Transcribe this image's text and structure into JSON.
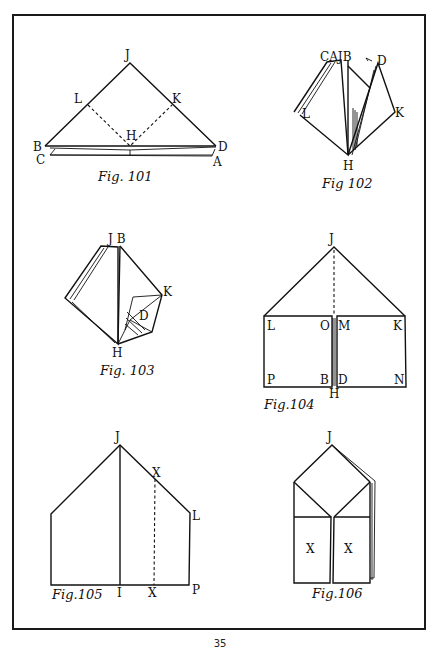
{
  "page": {
    "number": "35"
  },
  "figures": [
    {
      "id": "fig101",
      "caption": "Fig. 101",
      "labels": {
        "J": "J",
        "L": "L",
        "K": "K",
        "H": "H",
        "B": "B",
        "D": "D",
        "C": "C",
        "A": "A"
      }
    },
    {
      "id": "fig102",
      "caption": "Fig 102",
      "labels": {
        "CAJB": "CAJB",
        "D": "D",
        "L": "L",
        "K": "K",
        "H": "H"
      }
    },
    {
      "id": "fig103",
      "caption": "Fig. 103",
      "labels": {
        "JB": "J B",
        "K": "K",
        "D": "D",
        "H": "H"
      }
    },
    {
      "id": "fig104",
      "caption": "Fig.104",
      "labels": {
        "J": "J",
        "L": "L",
        "O": "O",
        "M": "M",
        "K": "K",
        "P": "P",
        "B": "B",
        "D": "D",
        "N": "N",
        "H": "H"
      }
    },
    {
      "id": "fig105",
      "caption": "Fig.105",
      "labels": {
        "J": "J",
        "X1": "X",
        "L": "L",
        "I": "I",
        "X2": "X",
        "P": "P"
      }
    },
    {
      "id": "fig106",
      "caption": "Fig.106",
      "labels": {
        "J": "J",
        "X1": "X",
        "X2": "X"
      }
    }
  ]
}
